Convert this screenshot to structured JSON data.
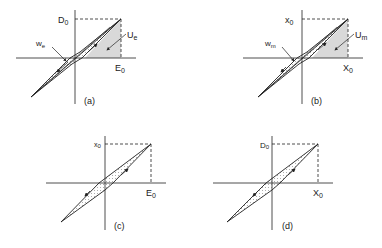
{
  "figure": {
    "colors": {
      "line": "#222222",
      "shade": "#d9d9d9",
      "dots": "#555555",
      "background": "#ffffff"
    },
    "panels": [
      {
        "id": "a",
        "caption": "(a)",
        "y_label": "D",
        "y_label_sub": "0",
        "x_label": "E",
        "x_label_sub": "0",
        "loss_label": "w",
        "loss_label_sub": "e",
        "energy_label": "U",
        "energy_label_sub": "e",
        "shaded_energy": true
      },
      {
        "id": "b",
        "caption": "(b)",
        "y_label": "x",
        "y_label_sub": "0",
        "x_label": "X",
        "x_label_sub": "0",
        "loss_label": "w",
        "loss_label_sub": "m",
        "energy_label": "U",
        "energy_label_sub": "m",
        "shaded_energy": true
      },
      {
        "id": "c",
        "caption": "(c)",
        "y_label": "x",
        "y_label_sub": "0",
        "x_label": "E",
        "x_label_sub": "0",
        "shaded_energy": false
      },
      {
        "id": "d",
        "caption": "(d)",
        "y_label": "D",
        "y_label_sub": "0",
        "x_label": "X",
        "x_label_sub": "0",
        "shaded_energy": false
      }
    ]
  }
}
